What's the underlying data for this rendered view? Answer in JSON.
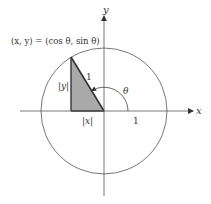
{
  "diagram": {
    "point_label": "(x, y) = (cos θ, sin θ)",
    "axes": {
      "x_label": "x",
      "y_label": "y"
    },
    "labels": {
      "hypotenuse": "1",
      "vertical_leg": "|y|",
      "horizontal_leg": "|x|",
      "angle": "θ",
      "x_axis_unit": "1"
    },
    "colors": {
      "triangle_fill": "#a9a9a9",
      "stroke": "#444444",
      "background": "#ffffff"
    },
    "geometry": {
      "origin": [
        104,
        111
      ],
      "radius": 63,
      "point": [
        71,
        57
      ],
      "angle_deg": 121
    }
  }
}
